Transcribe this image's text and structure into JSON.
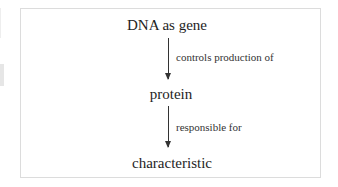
{
  "diagram": {
    "nodes": [
      {
        "id": "dna",
        "label": "DNA as gene"
      },
      {
        "id": "protein",
        "label": "protein"
      },
      {
        "id": "characteristic",
        "label": "characteristic"
      }
    ],
    "edges": [
      {
        "from": "dna",
        "to": "protein",
        "label": "controls production of"
      },
      {
        "from": "protein",
        "to": "characteristic",
        "label": "responsible for"
      }
    ]
  },
  "colors": {
    "frame_border": "#dcdcdc",
    "text": "#1e1e1e",
    "arrow": "#333333"
  }
}
